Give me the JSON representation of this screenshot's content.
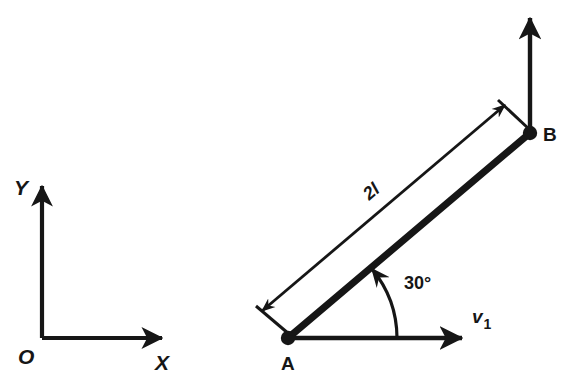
{
  "figure": {
    "type": "mechanics-diagram",
    "background_color": "#ffffff",
    "ink_color": "#161616",
    "axes": {
      "origin_label": "O",
      "x_label": "X",
      "y_label": "Y",
      "origin_px": [
        42,
        338
      ],
      "x_tip_px": [
        168,
        338
      ],
      "y_tip_px": [
        42,
        180
      ]
    },
    "rod": {
      "start_label": "A",
      "end_label": "B",
      "start_px": [
        288,
        338
      ],
      "end_px": [
        530,
        133
      ],
      "length_label": "2l",
      "angle_label": "30°",
      "angle_value_deg": 30
    },
    "vectors": {
      "velocity_label": "v",
      "velocity_subscript": "1",
      "velocity_full": "v1",
      "velocity_from_px": [
        288,
        338
      ],
      "velocity_to_px": [
        468,
        338
      ],
      "b_vertical_from_px": [
        530,
        133
      ],
      "b_vertical_to_px": [
        530,
        12
      ]
    },
    "caption_fragment": ""
  }
}
